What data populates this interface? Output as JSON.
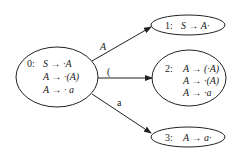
{
  "diagram": {
    "type": "LR(0) item-set automaton",
    "states": [
      {
        "id": "0",
        "label": "0:",
        "items": [
          "S → ·A",
          "A → ·(A)",
          "A → · a"
        ]
      },
      {
        "id": "1",
        "label": "1:",
        "items": [
          "S → A·"
        ]
      },
      {
        "id": "2",
        "label": "2:",
        "items": [
          "A → (·A)",
          "A → ·(A)",
          "A → ·a"
        ]
      },
      {
        "id": "3",
        "label": "3:",
        "items": [
          "A → a·"
        ]
      }
    ],
    "transitions": [
      {
        "from": "0",
        "to": "1",
        "symbol": "A"
      },
      {
        "from": "0",
        "to": "2",
        "symbol": "("
      },
      {
        "from": "0",
        "to": "3",
        "symbol": "a"
      }
    ],
    "colors": {
      "stroke": "#222222",
      "background": "#ffffff"
    }
  }
}
